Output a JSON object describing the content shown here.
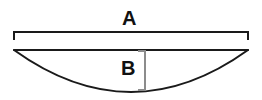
{
  "diagram": {
    "type": "circular-segment-dimension-drawing",
    "background_color": "#ffffff",
    "line_color": "#1a1a1a",
    "text_color": "#111111",
    "width_px": 262,
    "height_px": 100,
    "labels": {
      "width_label": "A",
      "height_label": "B"
    },
    "dimensions": {
      "width_dimension": {
        "label": "A",
        "kind": "horizontal-span",
        "bracket_style": "square-ends-down",
        "x_start_px": 14,
        "x_end_px": 248,
        "line_y_px": 32,
        "tick_length_px": 7,
        "span_px": 234
      },
      "height_dimension": {
        "label": "B",
        "kind": "vertical-span",
        "bracket_style": "square-ends-left",
        "x_px": 145,
        "y_start_px": 51,
        "y_end_px": 90,
        "tick_length_px": 6,
        "span_px": 39
      }
    },
    "shape": {
      "name": "circular-segment",
      "chord": {
        "x_start_px": 14,
        "x_end_px": 248,
        "y_px": 50
      },
      "arc": {
        "x_start_px": 14,
        "x_end_px": 248,
        "y_start_px": 50,
        "sagitta_px": 42,
        "lowest_point_y_px": 92,
        "lowest_point_x_px": 131,
        "direction": "downward"
      },
      "stroke_width_px": 2
    }
  }
}
